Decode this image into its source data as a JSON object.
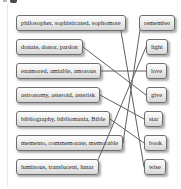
{
  "exercise": {
    "left_items": [
      "philosopher, sophisticated, sophomore",
      "donate, donor, pardon",
      "enamored, amiable, amorous",
      "astronomy, asteroid, asterisk",
      "bibliography, bibliomania, Bible",
      "memento, commemorate, memorable",
      "luminous, translucent, lunar"
    ],
    "right_items": [
      "remember",
      "light",
      "love",
      "give",
      "star",
      "book",
      "wise"
    ],
    "connections": [
      {
        "left": 0,
        "right": 6
      },
      {
        "left": 1,
        "right": 3
      },
      {
        "left": 2,
        "right": 2
      },
      {
        "left": 3,
        "right": 4
      },
      {
        "left": 4,
        "right": 5
      },
      {
        "left": 5,
        "right": 0
      },
      {
        "left": 6,
        "right": 1
      }
    ],
    "colors": {
      "page_background": "#ffffff",
      "box_border": "#6e6e6e",
      "box_fill_top": "#fdfdfd",
      "box_fill_bottom": "#d6d6d6",
      "line": "#5f5f5f",
      "text": "#1f1f1f"
    }
  }
}
